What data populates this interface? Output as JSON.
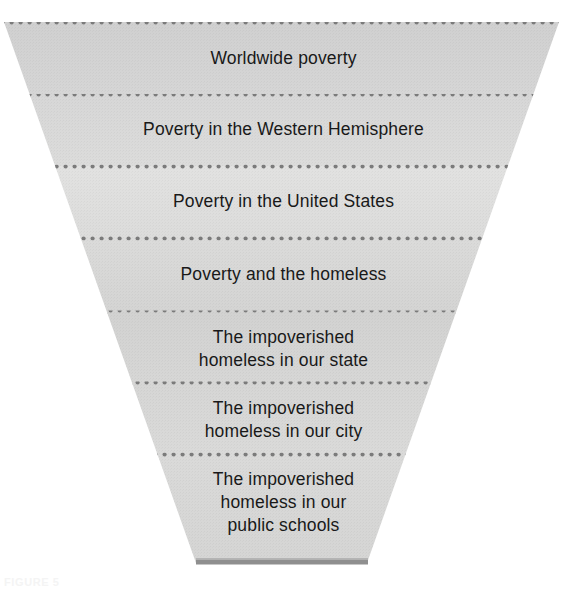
{
  "figure": {
    "type": "funnel",
    "orientation": "inverted-trapezoid-stack",
    "shape": {
      "top_width_px": 556,
      "bottom_width_px": 172,
      "top_y_px": 22,
      "bottom_y_px": 563,
      "fill_color": "#d2d2d2",
      "fill_color_light": "#dededd",
      "separator_color": "#7a7a7a",
      "base_bar_color": "#8f8f8f"
    },
    "bands": [
      {
        "index": 1,
        "lines": [
          "Worldwide poverty"
        ],
        "text": "Worldwide poverty",
        "scope": "worldwide",
        "top_y_px": 22,
        "bottom_y_px": 96,
        "shade": "#d3d3d3"
      },
      {
        "index": 2,
        "lines": [
          "Poverty in the Western Hemisphere"
        ],
        "text": "Poverty in the Western Hemisphere",
        "scope": "hemisphere",
        "top_y_px": 96,
        "bottom_y_px": 166,
        "shade": "#d6d6d6"
      },
      {
        "index": 3,
        "lines": [
          "Poverty in the United States"
        ],
        "text": "Poverty in the United States",
        "scope": "national",
        "top_y_px": 166,
        "bottom_y_px": 237,
        "shade": "#e0e0df"
      },
      {
        "index": 4,
        "lines": [
          "Poverty and the homeless"
        ],
        "text": "Poverty and the homeless",
        "scope": "population-subset",
        "top_y_px": 237,
        "bottom_y_px": 312,
        "shade": "#dadad9"
      },
      {
        "index": 5,
        "lines": [
          "The impoverished",
          "homeless in our state"
        ],
        "text": "The impoverished homeless in our state",
        "scope": "state",
        "top_y_px": 312,
        "bottom_y_px": 383,
        "shade": "#d2d2d2"
      },
      {
        "index": 6,
        "lines": [
          "The impoverished",
          "homeless in our city"
        ],
        "text": "The impoverished homeless in our city",
        "scope": "city",
        "top_y_px": 383,
        "bottom_y_px": 454,
        "shade": "#d6d6d5"
      },
      {
        "index": 7,
        "lines": [
          "The impoverished",
          "homeless in our",
          "public schools"
        ],
        "text": "The impoverished homeless in our public schools",
        "scope": "public-schools",
        "top_y_px": 454,
        "bottom_y_px": 563,
        "shade": "#d8d8d7"
      }
    ],
    "separators": [
      {
        "index": 1,
        "y_px": 96
      },
      {
        "index": 2,
        "y_px": 166
      },
      {
        "index": 3,
        "y_px": 237
      },
      {
        "index": 4,
        "y_px": 312
      },
      {
        "index": 5,
        "y_px": 383
      },
      {
        "index": 6,
        "y_px": 454
      }
    ]
  },
  "artifacts": {
    "top_right": "",
    "bottom_left": "FIGURE 5"
  }
}
